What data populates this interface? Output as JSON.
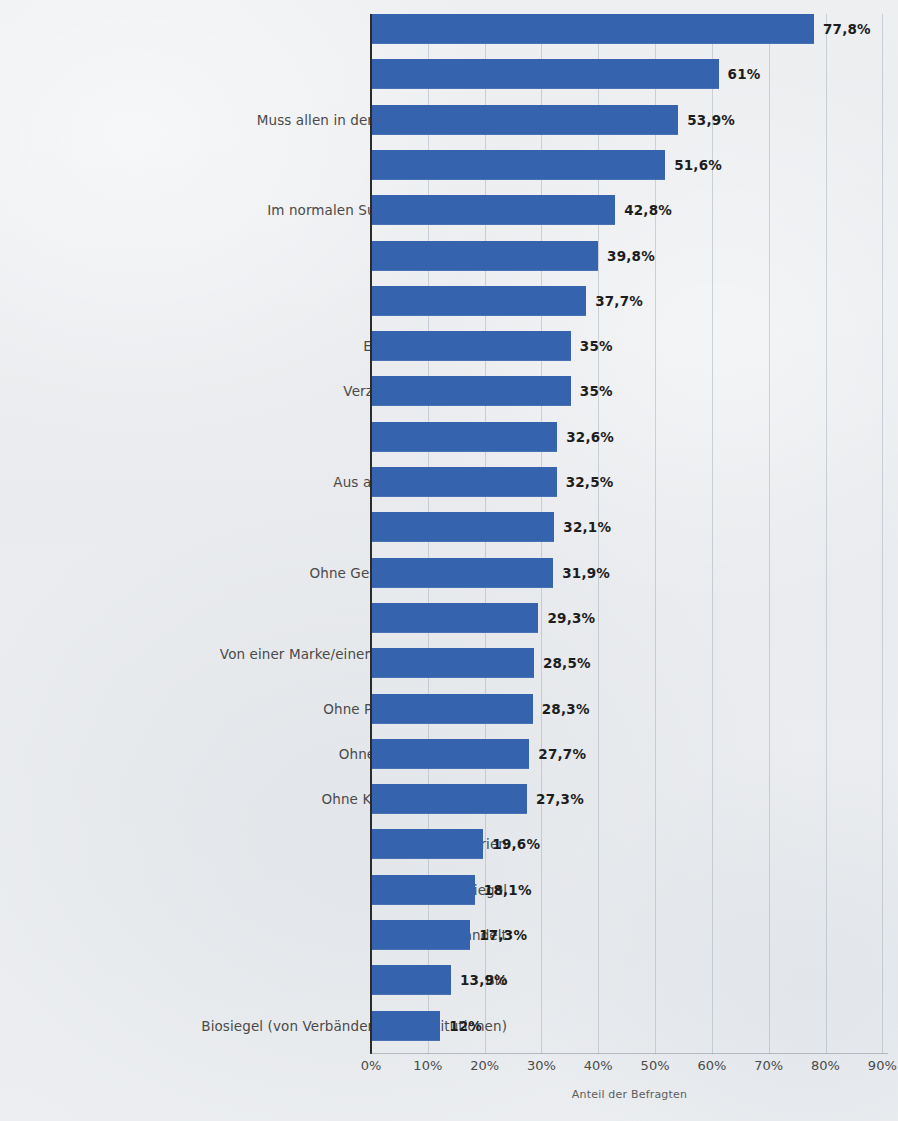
{
  "chart_data": {
    "type": "bar",
    "orientation": "horizontal",
    "title": "",
    "subtitle": "",
    "xlabel": "Anteil der Befragten",
    "ylabel": "",
    "xlim": [
      0,
      90
    ],
    "grid": true,
    "legend": null,
    "bar_color": "#3563ad",
    "xticks": [
      "0%",
      "10%",
      "20%",
      "30%",
      "40%",
      "50%",
      "60%",
      "70%",
      "80%",
      "90%"
    ],
    "xtick_values": [
      0,
      10,
      20,
      30,
      40,
      50,
      60,
      70,
      80,
      90
    ],
    "categories": [
      "Frische",
      "Preis",
      "Muss allen in der Familie schmecken",
      "Hohe Qualität",
      "Im normalen Supermarkt erhältlich",
      "Natürlichkeit",
      "Lange Haltbarkeit",
      "Einfach zuzubereiten",
      "Verzicht auf Gentechnik",
      "Saisonal",
      "Aus artgerechter Haltung",
      "Herkunft",
      "Ohne Geschmacksverstärker",
      "Aus meiner Region",
      "Von einer Marke/einem Produzenten, dem ich vertraue",
      "Ohne Pflanzenschutzmittel",
      "Ohne künstliche Aromen",
      "Ohne Konservierungsstoffe",
      "Wenig Kalorien",
      "Qualitätssiegel",
      "Fair gehandelt",
      "Bio",
      "Biosiegel (von Verbänden bzw. Institutionen)"
    ],
    "values": [
      77.8,
      61,
      53.9,
      51.6,
      42.8,
      39.8,
      37.7,
      35,
      35,
      32.6,
      32.5,
      32.1,
      31.9,
      29.3,
      28.5,
      28.3,
      27.7,
      27.3,
      19.6,
      18.1,
      17.3,
      13.9,
      12
    ],
    "value_labels": [
      "77,8%",
      "61%",
      "53,9%",
      "51,6%",
      "42,8%",
      "39,8%",
      "37,7%",
      "35%",
      "35%",
      "32,6%",
      "32,5%",
      "32,1%",
      "31,9%",
      "29,3%",
      "28,5%",
      "28,3%",
      "27,7%",
      "27,3%",
      "19,6%",
      "18,1%",
      "17,3%",
      "13,9%",
      "12%"
    ],
    "category_lines": [
      [
        "Frische"
      ],
      [
        "Preis"
      ],
      [
        "Muss allen in der Familie schmecken"
      ],
      [
        "Hohe Qualität"
      ],
      [
        "Im normalen Supermarkt erhältlich"
      ],
      [
        "Natürlichkeit"
      ],
      [
        "Lange Haltbarkeit"
      ],
      [
        "Einfach zuzubereiten"
      ],
      [
        "Verzicht auf Gentechnik"
      ],
      [
        "Saisonal"
      ],
      [
        "Aus artgerechter Haltung"
      ],
      [
        "Herkunft"
      ],
      [
        "Ohne Geschmacksverstärker"
      ],
      [
        "Aus meiner Region"
      ],
      [
        "Von einer Marke/einem Produzenten, dem",
        "ich vertraue"
      ],
      [
        "Ohne Pflanzenschutzmittel"
      ],
      [
        "Ohne künstliche Aromen"
      ],
      [
        "Ohne Konservierungsstoffe"
      ],
      [
        "Wenig Kalorien"
      ],
      [
        "Qualitätssiegel"
      ],
      [
        "Fair gehandelt"
      ],
      [
        "Bio"
      ],
      [
        "Biosiegel (von Verbänden bzw. Institutionen)"
      ]
    ]
  }
}
